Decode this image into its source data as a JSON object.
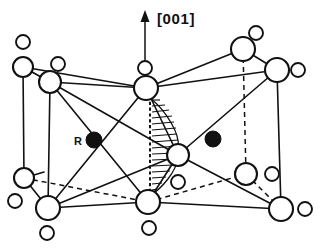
{
  "figure": {
    "background_color": "#ffffff",
    "line_color": "#111111",
    "width": 321,
    "height": 251
  },
  "axis": {
    "name": "direction-axis",
    "label": "[001]",
    "label_x": 158,
    "label_y": 20,
    "arrow_x": 145,
    "arrow_tip_y": 12,
    "arrow_base_y": 74
  },
  "labels": [
    {
      "id": "r-site",
      "text": "R",
      "x": 80,
      "y": 143
    }
  ],
  "legend_markers": [
    {
      "id": "r-marker",
      "kind": "filled",
      "cx": 94,
      "cy": 140,
      "r": 8
    },
    {
      "id": "second-filled-marker",
      "kind": "filled",
      "cx": 213,
      "cy": 139,
      "r": 8
    }
  ],
  "atoms_large": [
    {
      "id": "a-top-left-upper",
      "cx": 23,
      "cy": 67,
      "r": 10
    },
    {
      "id": "a-top-left-inner",
      "cx": 50,
      "cy": 82,
      "r": 11
    },
    {
      "id": "a-top-center",
      "cx": 146,
      "cy": 88,
      "r": 12
    },
    {
      "id": "a-top-right-back",
      "cx": 243,
      "cy": 49,
      "r": 12
    },
    {
      "id": "a-top-right-front",
      "cx": 277,
      "cy": 70,
      "r": 12
    },
    {
      "id": "a-center",
      "cx": 178,
      "cy": 155,
      "r": 11
    },
    {
      "id": "a-bot-left-back",
      "cx": 24,
      "cy": 178,
      "r": 10
    },
    {
      "id": "a-bot-left-front",
      "cx": 48,
      "cy": 208,
      "r": 12
    },
    {
      "id": "a-bot-center",
      "cx": 148,
      "cy": 202,
      "r": 12
    },
    {
      "id": "a-bot-right-back",
      "cx": 246,
      "cy": 174,
      "r": 11
    },
    {
      "id": "a-bot-right-front",
      "cx": 281,
      "cy": 209,
      "r": 12
    }
  ],
  "atoms_small": [
    {
      "id": "s-top-left-out",
      "cx": 23,
      "cy": 42,
      "r": 7
    },
    {
      "id": "s-top-left-in",
      "cx": 58,
      "cy": 64,
      "r": 7
    },
    {
      "id": "s-top-center-up",
      "cx": 145,
      "cy": 68,
      "r": 7
    },
    {
      "id": "s-top-right-up",
      "cx": 256,
      "cy": 33,
      "r": 7
    },
    {
      "id": "s-top-right-out",
      "cx": 298,
      "cy": 70,
      "r": 7
    },
    {
      "id": "s-center-down",
      "cx": 178,
      "cy": 182,
      "r": 7
    },
    {
      "id": "s-bot-left-out",
      "cx": 15,
      "cy": 201,
      "r": 7
    },
    {
      "id": "s-bot-center-down",
      "cx": 149,
      "cy": 228,
      "r": 7
    },
    {
      "id": "s-bot-right-in",
      "cx": 272,
      "cy": 174,
      "r": 7
    },
    {
      "id": "s-bot-right-out",
      "cx": 305,
      "cy": 209,
      "r": 7
    },
    {
      "id": "s-bot-left-down",
      "cx": 47,
      "cy": 233,
      "r": 7
    }
  ],
  "edges_solid": [
    {
      "id": "e1",
      "x1": 23,
      "y1": 67,
      "x2": 50,
      "y2": 82
    },
    {
      "id": "e2",
      "x1": 23,
      "y1": 67,
      "x2": 24,
      "y2": 178
    },
    {
      "id": "e3",
      "x1": 50,
      "y1": 82,
      "x2": 48,
      "y2": 208
    },
    {
      "id": "e4",
      "x1": 50,
      "y1": 82,
      "x2": 146,
      "y2": 88
    },
    {
      "id": "e5",
      "x1": 23,
      "y1": 67,
      "x2": 146,
      "y2": 88
    },
    {
      "id": "e6",
      "x1": 146,
      "y1": 88,
      "x2": 243,
      "y2": 49
    },
    {
      "id": "e7",
      "x1": 146,
      "y1": 88,
      "x2": 277,
      "y2": 70
    },
    {
      "id": "e8",
      "x1": 243,
      "y1": 49,
      "x2": 277,
      "y2": 70
    },
    {
      "id": "e9",
      "x1": 50,
      "y1": 82,
      "x2": 178,
      "y2": 155
    },
    {
      "id": "e10",
      "x1": 50,
      "y1": 82,
      "x2": 148,
      "y2": 202
    },
    {
      "id": "e11",
      "x1": 48,
      "y1": 208,
      "x2": 146,
      "y2": 88
    },
    {
      "id": "e12",
      "x1": 48,
      "y1": 208,
      "x2": 148,
      "y2": 202
    },
    {
      "id": "e13",
      "x1": 48,
      "y1": 208,
      "x2": 178,
      "y2": 155
    },
    {
      "id": "e14",
      "x1": 178,
      "y1": 155,
      "x2": 277,
      "y2": 70
    },
    {
      "id": "e15",
      "x1": 178,
      "y1": 155,
      "x2": 281,
      "y2": 209
    },
    {
      "id": "e16",
      "x1": 148,
      "y1": 202,
      "x2": 281,
      "y2": 209
    },
    {
      "id": "e17",
      "x1": 277,
      "y1": 70,
      "x2": 281,
      "y2": 209
    },
    {
      "id": "e18",
      "x1": 146,
      "y1": 88,
      "x2": 178,
      "y2": 155
    },
    {
      "id": "e19",
      "x1": 148,
      "y1": 202,
      "x2": 178,
      "y2": 155
    },
    {
      "id": "e20",
      "x1": 24,
      "y1": 178,
      "x2": 48,
      "y2": 208
    },
    {
      "id": "e21",
      "x1": 146,
      "y1": 88,
      "x2": 148,
      "y2": 202
    }
  ],
  "edges_dashed": [
    {
      "id": "d1",
      "x1": 24,
      "y1": 178,
      "x2": 148,
      "y2": 202
    },
    {
      "id": "d2",
      "x1": 148,
      "y1": 202,
      "x2": 246,
      "y2": 174
    },
    {
      "id": "d3",
      "x1": 246,
      "y1": 174,
      "x2": 281,
      "y2": 209
    },
    {
      "id": "d4",
      "x1": 243,
      "y1": 49,
      "x2": 246,
      "y2": 174
    },
    {
      "id": "d5",
      "x1": 24,
      "y1": 178,
      "x2": 44,
      "y2": 188
    }
  ],
  "hatched_region": {
    "id": "shaded-plane",
    "description": "hatched (0 1 0)-type plane between top-center, center and bottom-center atoms",
    "left_edge_x": 150,
    "top_y": 96,
    "bottom_y": 196,
    "apex_x": 176,
    "apex_y": 152,
    "line_count": 15
  }
}
